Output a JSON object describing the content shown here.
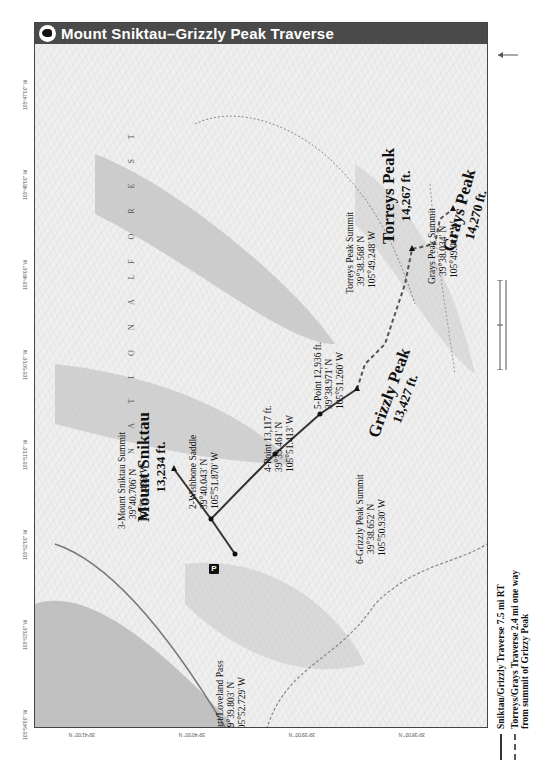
{
  "title": {
    "icon": "bighorn-sheep-icon",
    "text": "Mount Sniktau–Grizzly Peak Traverse"
  },
  "map": {
    "area_label_words": [
      "N A T I O N A L",
      "F O R E S T"
    ],
    "waypoints": [
      {
        "id": 1,
        "name": "1-Start/Loveland Pass",
        "lat": "39°39.803' N",
        "lon": "105°52.729' W"
      },
      {
        "id": 2,
        "name": "2-Wishbone Saddle",
        "lat": "39°40.043' N",
        "lon": "105°51.870' W"
      },
      {
        "id": 3,
        "name": "3-Mount Sniktau Summit",
        "lat": "39°40.706' N",
        "lon": "105°51.459' W"
      },
      {
        "id": 4,
        "name": "4-Point 13,117 ft.",
        "lat": "39°39.461' N",
        "lon": "105°51.413' W"
      },
      {
        "id": 5,
        "name": "5-Point 12,936 ft.",
        "lat": "39°38.971' N",
        "lon": "105°51.260' W"
      },
      {
        "id": 6,
        "name": "6-Grizzly Peak Summit",
        "lat": "39°38.652' N",
        "lon": "105°50.930' W"
      },
      {
        "id": 7,
        "name": "Torreys Peak Summit",
        "lat": "39°38.568' N",
        "lon": "105°49.248' W"
      },
      {
        "id": 8,
        "name": "Grays Peak Summit",
        "lat": "39°38.034' N",
        "lon": "105°49.014' W"
      }
    ],
    "peaks": [
      {
        "name": "Mount Sniktau",
        "elevation": "13,234 ft."
      },
      {
        "name": "Grizzly Peak",
        "elevation": "13,427 ft."
      },
      {
        "name": "Torreys Peak",
        "elevation": "14,267 ft."
      },
      {
        "name": "Grays Peak",
        "elevation": "14,270 ft."
      }
    ],
    "parking_label": "P",
    "longitude_ticks": [
      "105°54'00\" W",
      "105°53'00\" W",
      "105°52'00\" W",
      "105°51'00\" W",
      "105°50'00\" W",
      "105°49'00\" W",
      "105°48'00\" W",
      "105°47'00\" W"
    ],
    "latitude_ticks": [
      "39°41'00\" N",
      "39°40'00\" N",
      "39°39'00\" N",
      "39°38'00\" N"
    ]
  },
  "legend": {
    "items": [
      {
        "style": "solid",
        "label": "Sniktau/Grizzly Traverse 7.5 mi RT"
      },
      {
        "style": "dashed",
        "label_line1": "Torreys/Grays Traverse 2.4 mi one way",
        "label_line2": "from summit of Grizzy Peak"
      }
    ]
  },
  "colors": {
    "title_bar": "#4a4a4a",
    "route_solid": "#333333",
    "route_dashed": "#555555",
    "map_bg": "#f2f2f2"
  }
}
